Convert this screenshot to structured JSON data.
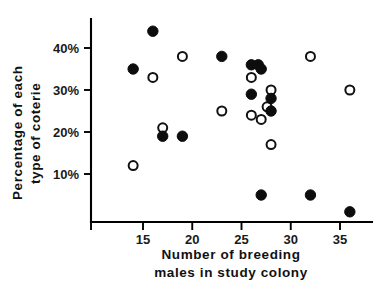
{
  "chart_data": {
    "type": "scatter",
    "title": "",
    "xlabel": "Number of breeding males in study colony",
    "xlabel_line1": "Number of breeding",
    "xlabel_line2": "males in study colony",
    "ylabel": "Percentage of each type of coterie",
    "ylabel_line1": "Percentage of each",
    "ylabel_line2": "type of coterie",
    "xlim": [
      11.5,
      37.5
    ],
    "ylim": [
      0,
      46
    ],
    "grid": false,
    "legend": "none",
    "xticks": [
      15,
      20,
      25,
      30,
      35
    ],
    "xtick_labels": [
      "15",
      "20",
      "25",
      "30",
      "35"
    ],
    "yticks": [
      10,
      20,
      30,
      40
    ],
    "ytick_labels": [
      "10%",
      "20%",
      "30%",
      "40%"
    ],
    "marker_colors": {
      "filled": "#0d0d0d",
      "open_stroke": "#111111",
      "open_fill": "#ffffff"
    },
    "series": [
      {
        "name": "filled",
        "marker": "filled-circle",
        "points": [
          {
            "x": 14,
            "y": 35
          },
          {
            "x": 16,
            "y": 44
          },
          {
            "x": 17,
            "y": 19
          },
          {
            "x": 19,
            "y": 19
          },
          {
            "x": 23,
            "y": 38
          },
          {
            "x": 26,
            "y": 36
          },
          {
            "x": 26.7,
            "y": 36
          },
          {
            "x": 26,
            "y": 29
          },
          {
            "x": 27,
            "y": 35
          },
          {
            "x": 28,
            "y": 28
          },
          {
            "x": 28,
            "y": 25
          },
          {
            "x": 27,
            "y": 5
          },
          {
            "x": 32,
            "y": 5
          },
          {
            "x": 36,
            "y": 1
          }
        ]
      },
      {
        "name": "open",
        "marker": "open-circle",
        "points": [
          {
            "x": 14,
            "y": 12
          },
          {
            "x": 16,
            "y": 33
          },
          {
            "x": 17,
            "y": 21
          },
          {
            "x": 19,
            "y": 38
          },
          {
            "x": 23,
            "y": 25
          },
          {
            "x": 26,
            "y": 33
          },
          {
            "x": 26,
            "y": 24
          },
          {
            "x": 27,
            "y": 23
          },
          {
            "x": 27.6,
            "y": 26
          },
          {
            "x": 28,
            "y": 30
          },
          {
            "x": 28,
            "y": 17
          },
          {
            "x": 32,
            "y": 38
          },
          {
            "x": 36,
            "y": 30
          }
        ]
      }
    ]
  }
}
